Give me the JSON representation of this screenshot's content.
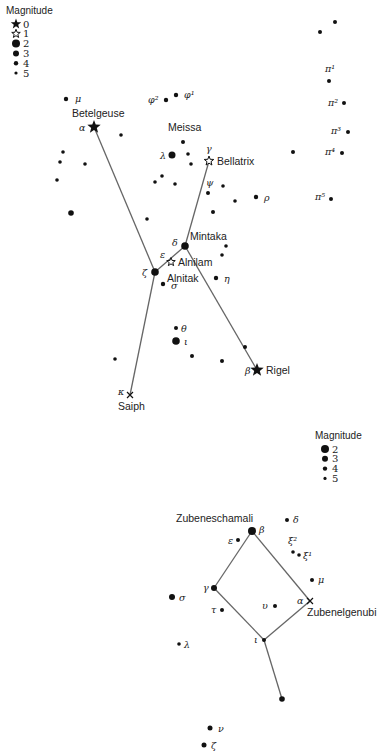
{
  "legend_top": {
    "title": "Magnitude",
    "x": 6,
    "y": 14,
    "items": [
      {
        "label": "0",
        "symbol": "star-filled"
      },
      {
        "label": "1",
        "symbol": "star-open"
      },
      {
        "label": "2",
        "symbol": "dot",
        "r": 4
      },
      {
        "label": "3",
        "symbol": "dot",
        "r": 3
      },
      {
        "label": "4",
        "symbol": "dot",
        "r": 2.2
      },
      {
        "label": "5",
        "symbol": "dot",
        "r": 1.6
      }
    ]
  },
  "legend_bottom": {
    "title": "Magnitude",
    "x": 315,
    "y": 439,
    "items": [
      {
        "label": "2",
        "symbol": "dot",
        "r": 4
      },
      {
        "label": "3",
        "symbol": "dot",
        "r": 3
      },
      {
        "label": "4",
        "symbol": "dot",
        "r": 2.2
      },
      {
        "label": "5",
        "symbol": "dot",
        "r": 1.6
      }
    ]
  },
  "orion": {
    "stars": [
      {
        "id": "betelgeuse",
        "x": 94,
        "y": 127,
        "symbol": "star-filled",
        "size": 7,
        "greek": "α",
        "gx": 79,
        "gy": 131,
        "name": "Betelgeuse",
        "nx": 72,
        "ny": 117
      },
      {
        "id": "rigel",
        "x": 257,
        "y": 370,
        "symbol": "star-filled",
        "size": 7,
        "greek": "β",
        "gx": 245,
        "gy": 374,
        "name": "Rigel",
        "nx": 266,
        "ny": 374
      },
      {
        "id": "bellatrix",
        "x": 209,
        "y": 161,
        "symbol": "star-open",
        "size": 5,
        "greek": "γ",
        "gx": 206,
        "gy": 152,
        "name": "Bellatrix",
        "nx": 217,
        "ny": 165
      },
      {
        "id": "mintaka",
        "x": 185,
        "y": 246,
        "symbol": "dot",
        "r": 3.8,
        "greek": "δ",
        "gx": 172,
        "gy": 246,
        "name": "Mintaka",
        "nx": 190,
        "ny": 240
      },
      {
        "id": "alnilam",
        "x": 171,
        "y": 262,
        "symbol": "star-open",
        "size": 4.5,
        "greek": "ε",
        "gx": 160,
        "gy": 258,
        "name": "Alnilam",
        "nx": 178,
        "ny": 266
      },
      {
        "id": "alnitak",
        "x": 155,
        "y": 272,
        "symbol": "dot",
        "r": 3.8,
        "greek": "ζ",
        "gx": 142,
        "gy": 276,
        "name": "Alnitak",
        "nx": 167,
        "ny": 282
      },
      {
        "id": "saiph",
        "x": 130,
        "y": 395,
        "symbol": "cross",
        "size": 3,
        "greek": "κ",
        "gx": 118,
        "gy": 395,
        "name": "Saiph",
        "nx": 118,
        "ny": 410
      },
      {
        "id": "meissa",
        "x": 183,
        "y": 142,
        "symbol": "dot",
        "r": 2,
        "greek": "",
        "name": "Meissa",
        "nx": 168,
        "ny": 131
      },
      {
        "id": "lambda2",
        "x": 172,
        "y": 155,
        "symbol": "dot",
        "r": 3.5,
        "greek": "λ",
        "gx": 160,
        "gy": 159
      },
      {
        "id": "mu",
        "x": 66,
        "y": 99,
        "symbol": "dot",
        "r": 2.2,
        "greek": "μ",
        "gx": 75,
        "gy": 102
      },
      {
        "id": "phi1",
        "x": 176,
        "y": 95,
        "symbol": "dot",
        "r": 2.2,
        "greek": "φ¹",
        "gx": 184,
        "gy": 98
      },
      {
        "id": "phi2",
        "x": 166,
        "y": 100,
        "symbol": "dot",
        "r": 2.2,
        "greek": "φ²",
        "gx": 148,
        "gy": 103
      },
      {
        "id": "psi",
        "x": 208,
        "y": 193,
        "symbol": "dot",
        "r": 2,
        "greek": "ψ",
        "gx": 206,
        "gy": 186
      },
      {
        "id": "rho",
        "x": 256,
        "y": 197,
        "symbol": "dot",
        "r": 2.2,
        "greek": "ρ",
        "gx": 264,
        "gy": 201
      },
      {
        "id": "eta",
        "x": 216,
        "y": 278,
        "symbol": "dot",
        "r": 2.2,
        "greek": "η",
        "gx": 224,
        "gy": 282
      },
      {
        "id": "sigma",
        "x": 163,
        "y": 284,
        "symbol": "dot",
        "r": 2.2,
        "greek": "σ",
        "gx": 171,
        "gy": 289
      },
      {
        "id": "theta",
        "x": 176,
        "y": 328,
        "symbol": "dot",
        "r": 2,
        "greek": "θ",
        "gx": 181,
        "gy": 332
      },
      {
        "id": "iota",
        "x": 176,
        "y": 341,
        "symbol": "dot",
        "r": 3.8,
        "greek": "ι",
        "gx": 184,
        "gy": 345
      },
      {
        "id": "pi1",
        "x": 329,
        "y": 81,
        "symbol": "dot",
        "r": 2,
        "greek": "π¹",
        "gx": 325,
        "gy": 72
      },
      {
        "id": "pi2",
        "x": 344,
        "y": 103,
        "symbol": "dot",
        "r": 2,
        "greek": "π²",
        "gx": 328,
        "gy": 106
      },
      {
        "id": "pi3",
        "x": 348,
        "y": 132,
        "symbol": "dot",
        "r": 2,
        "greek": "π³",
        "gx": 331,
        "gy": 134
      },
      {
        "id": "pi4",
        "x": 342,
        "y": 153,
        "symbol": "dot",
        "r": 2,
        "greek": "π⁴",
        "gx": 325,
        "gy": 155
      },
      {
        "id": "pi5",
        "x": 331,
        "y": 199,
        "symbol": "dot",
        "r": 2,
        "greek": "π⁵",
        "gx": 315,
        "gy": 200
      }
    ],
    "unnamed": [
      {
        "x": 335,
        "y": 22,
        "r": 2
      },
      {
        "x": 320,
        "y": 32,
        "r": 2
      },
      {
        "x": 293,
        "y": 152,
        "r": 2
      },
      {
        "x": 121,
        "y": 135,
        "r": 1.8
      },
      {
        "x": 63,
        "y": 152,
        "r": 1.8
      },
      {
        "x": 60,
        "y": 162,
        "r": 1.8
      },
      {
        "x": 85,
        "y": 164,
        "r": 1.8
      },
      {
        "x": 57,
        "y": 180,
        "r": 1.8
      },
      {
        "x": 71,
        "y": 213,
        "r": 2.8
      },
      {
        "x": 188,
        "y": 154,
        "r": 1.8
      },
      {
        "x": 191,
        "y": 164,
        "r": 1.8
      },
      {
        "x": 155,
        "y": 182,
        "r": 1.8
      },
      {
        "x": 162,
        "y": 176,
        "r": 1.8
      },
      {
        "x": 175,
        "y": 184,
        "r": 1.8
      },
      {
        "x": 223,
        "y": 186,
        "r": 1.8
      },
      {
        "x": 235,
        "y": 201,
        "r": 1.8
      },
      {
        "x": 213,
        "y": 212,
        "r": 2
      },
      {
        "x": 147,
        "y": 219,
        "r": 1.8
      },
      {
        "x": 222,
        "y": 255,
        "r": 1.8
      },
      {
        "x": 226,
        "y": 246,
        "r": 1.8
      },
      {
        "x": 115,
        "y": 359,
        "r": 1.8
      },
      {
        "x": 192,
        "y": 356,
        "r": 2
      },
      {
        "x": 222,
        "y": 361,
        "r": 2
      },
      {
        "x": 245,
        "y": 347,
        "r": 2
      }
    ],
    "lines": [
      [
        [
          94,
          127
        ],
        [
          155,
          272
        ]
      ],
      [
        [
          209,
          161
        ],
        [
          185,
          246
        ]
      ],
      [
        [
          185,
          246
        ],
        [
          155,
          272
        ]
      ],
      [
        [
          185,
          246
        ],
        [
          257,
          370
        ]
      ],
      [
        [
          155,
          272
        ],
        [
          130,
          395
        ]
      ]
    ]
  },
  "libra": {
    "stars": [
      {
        "id": "zubeneschamali",
        "x": 252,
        "y": 531,
        "symbol": "dot",
        "r": 4,
        "greek": "β",
        "gx": 259,
        "gy": 533,
        "name": "Zubeneschamali",
        "nx": 176,
        "ny": 522
      },
      {
        "id": "zubenelgenubi",
        "x": 310,
        "y": 601,
        "symbol": "cross",
        "size": 3,
        "greek": "α",
        "gx": 297,
        "gy": 604,
        "name": "Zubenelgenubi",
        "nx": 307,
        "ny": 616
      },
      {
        "id": "gamma",
        "x": 214,
        "y": 588,
        "symbol": "dot",
        "r": 3,
        "greek": "γ",
        "gx": 203,
        "gy": 591
      },
      {
        "id": "iota",
        "x": 264,
        "y": 640,
        "symbol": "dot",
        "r": 2,
        "greek": "ι",
        "gx": 254,
        "gy": 643
      },
      {
        "id": "delta",
        "x": 287,
        "y": 520,
        "symbol": "dot",
        "r": 2,
        "greek": "δ",
        "gx": 293,
        "gy": 523
      },
      {
        "id": "epsilon",
        "x": 238,
        "y": 540,
        "symbol": "dot",
        "r": 2,
        "greek": "ε",
        "gx": 228,
        "gy": 544
      },
      {
        "id": "xi2",
        "x": 293,
        "y": 552,
        "symbol": "dot",
        "r": 1.8,
        "greek": "ξ²",
        "gx": 288,
        "gy": 544
      },
      {
        "id": "xi1",
        "x": 299,
        "y": 555,
        "symbol": "dot",
        "r": 1.8,
        "greek": "ξ¹",
        "gx": 303,
        "gy": 559
      },
      {
        "id": "mu",
        "x": 312,
        "y": 580,
        "symbol": "dot",
        "r": 2,
        "greek": "μ",
        "gx": 318,
        "gy": 583
      },
      {
        "id": "upsilon",
        "x": 275,
        "y": 606,
        "symbol": "dot",
        "r": 2,
        "greek": "υ",
        "gx": 262,
        "gy": 609
      },
      {
        "id": "tau",
        "x": 222,
        "y": 610,
        "symbol": "dot",
        "r": 2,
        "greek": "τ",
        "gx": 211,
        "gy": 613
      },
      {
        "id": "sigma",
        "x": 172,
        "y": 597,
        "symbol": "dot",
        "r": 3,
        "greek": "σ",
        "gx": 179,
        "gy": 601
      },
      {
        "id": "lambda",
        "x": 179,
        "y": 644,
        "symbol": "dot",
        "r": 1.8,
        "greek": "λ",
        "gx": 184,
        "gy": 648
      },
      {
        "id": "nu",
        "x": 210,
        "y": 728,
        "symbol": "dot",
        "r": 2.5,
        "greek": "ν",
        "gx": 218,
        "gy": 732
      },
      {
        "id": "zeta",
        "x": 204,
        "y": 745,
        "symbol": "dot",
        "r": 2.5,
        "greek": "ζ",
        "gx": 211,
        "gy": 749
      }
    ],
    "unnamed": [
      {
        "x": 282,
        "y": 699,
        "r": 2.8
      }
    ],
    "lines": [
      [
        [
          252,
          531
        ],
        [
          214,
          588
        ]
      ],
      [
        [
          252,
          531
        ],
        [
          310,
          601
        ]
      ],
      [
        [
          214,
          588
        ],
        [
          264,
          640
        ]
      ],
      [
        [
          310,
          601
        ],
        [
          264,
          640
        ]
      ],
      [
        [
          264,
          640
        ],
        [
          282,
          699
        ]
      ]
    ]
  }
}
